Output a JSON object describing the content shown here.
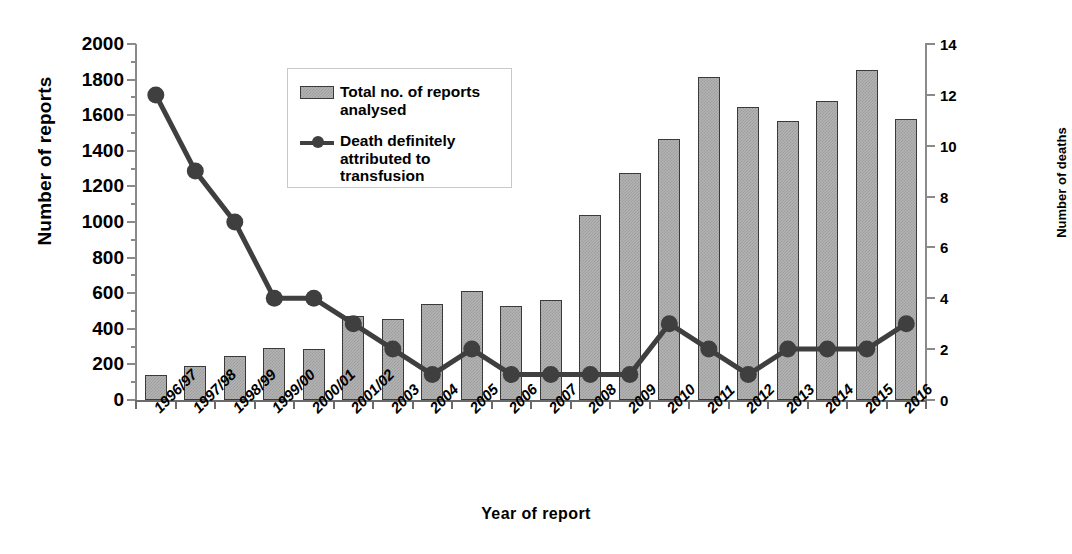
{
  "chart_data": {
    "type": "bar",
    "title": "",
    "xlabel": "Year of report",
    "ylabel": "Number of reports",
    "ylabel_secondary": "Number of deaths",
    "grid": false,
    "legend_position": "upper-left-inside",
    "categories": [
      "1996/97",
      "1997/98",
      "1998/99",
      "1999/00",
      "2000/01",
      "2001/02",
      "2003",
      "2004",
      "2005",
      "2006",
      "2007",
      "2008",
      "2009",
      "2010",
      "2011",
      "2012",
      "2013",
      "2014",
      "2015",
      "2016"
    ],
    "ylim": [
      0,
      2000
    ],
    "yticks": [
      0,
      200,
      400,
      600,
      800,
      1000,
      1200,
      1400,
      1600,
      1800,
      2000
    ],
    "ylim_secondary": [
      0,
      14
    ],
    "yticks_secondary": [
      0,
      2,
      4,
      6,
      8,
      10,
      12,
      14
    ],
    "series": [
      {
        "name": "Total no. of reports analysed",
        "render": "bar",
        "axis": "left",
        "color": "#b3b3b3",
        "edge_color": "#3a3a3a",
        "values": [
          140,
          190,
          245,
          290,
          285,
          470,
          455,
          540,
          610,
          530,
          560,
          1040,
          1275,
          1465,
          1815,
          1645,
          1570,
          1680,
          1855,
          1580
        ]
      },
      {
        "name": "Death definitely attributed to transfusion",
        "render": "line",
        "axis": "right",
        "color": "#3f3f3f",
        "marker": "circle",
        "values": [
          12,
          9,
          7,
          4,
          4,
          3,
          2,
          1,
          2,
          1,
          1,
          1,
          1,
          3,
          2,
          1,
          2,
          2,
          2,
          3
        ]
      }
    ]
  },
  "axes": {
    "left_title": "Number of reports",
    "right_title": "Number of deaths",
    "x_title": "Year of report"
  },
  "legend": {
    "items": [
      {
        "label": "Total no. of reports analysed",
        "marker": "bar-swatch"
      },
      {
        "label": "Death definitely attributed to transfusion",
        "marker": "line-with-dot"
      }
    ]
  }
}
